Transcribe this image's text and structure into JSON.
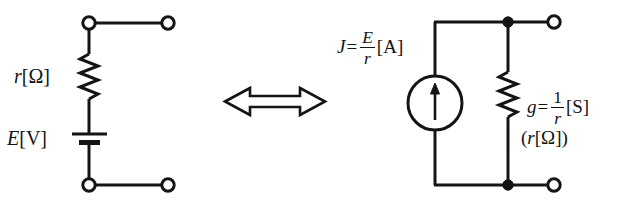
{
  "figure": {
    "name": "thevenin-norton-equivalence",
    "stroke_color": "#141414",
    "background_color": "#ffffff",
    "left_circuit": {
      "name": "voltage-source-circuit",
      "resistor_label": {
        "symbol": "r",
        "unit": "[Ω]"
      },
      "source_label": {
        "symbol": "E",
        "unit": "[V]"
      }
    },
    "equivalence_arrow": {
      "name": "double-headed-arrow",
      "direction": "left-right"
    },
    "right_circuit": {
      "name": "current-source-circuit",
      "source_label": {
        "symbol": "J",
        "equals": "=",
        "numerator": "E",
        "denominator": "r",
        "unit": "[A]"
      },
      "conductance_label": {
        "symbol": "g",
        "equals": "=",
        "numerator": "1",
        "denominator": "r",
        "unit": "[S]"
      },
      "resistance_note": {
        "open_paren": "(",
        "symbol": "r",
        "unit": "[Ω]",
        "close_paren": ")"
      }
    }
  }
}
